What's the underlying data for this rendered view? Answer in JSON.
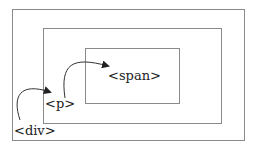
{
  "diagram": {
    "boxes": [
      {
        "id": "div",
        "label": "<div>"
      },
      {
        "id": "p",
        "label": "<p>"
      },
      {
        "id": "span",
        "label": "<span>"
      }
    ],
    "arrows": [
      {
        "from": "div",
        "to": "p"
      },
      {
        "from": "p",
        "to": "span"
      }
    ],
    "colors": {
      "border": "#8a8a8a",
      "text": "#222222",
      "arrow": "#222222"
    }
  }
}
